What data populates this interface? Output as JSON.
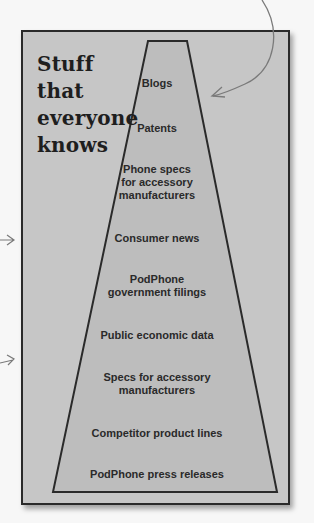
{
  "diagram": {
    "title_lines": [
      "Stuff that",
      "everyone",
      "knows"
    ],
    "colors": {
      "background": "#f7f7f7",
      "panel": "#c6c6c6",
      "trapezoid": "#bdbdbd",
      "outline": "#2a2a2a",
      "arrow": "#7a7a7a"
    },
    "pyramid_items": [
      {
        "lines": [
          "Blogs"
        ]
      },
      {
        "lines": [
          "Patents"
        ]
      },
      {
        "lines": [
          "Phone specs",
          "for accessory",
          "manufacturers"
        ]
      },
      {
        "lines": [
          "Consumer news"
        ]
      },
      {
        "lines": [
          "PodPhone",
          "government filings"
        ]
      },
      {
        "lines": [
          "Public economic data"
        ]
      },
      {
        "lines": [
          "Specs for accessory",
          "manufacturers"
        ]
      },
      {
        "lines": [
          "Competitor product lines"
        ]
      },
      {
        "lines": [
          "PodPhone press releases"
        ]
      }
    ]
  }
}
